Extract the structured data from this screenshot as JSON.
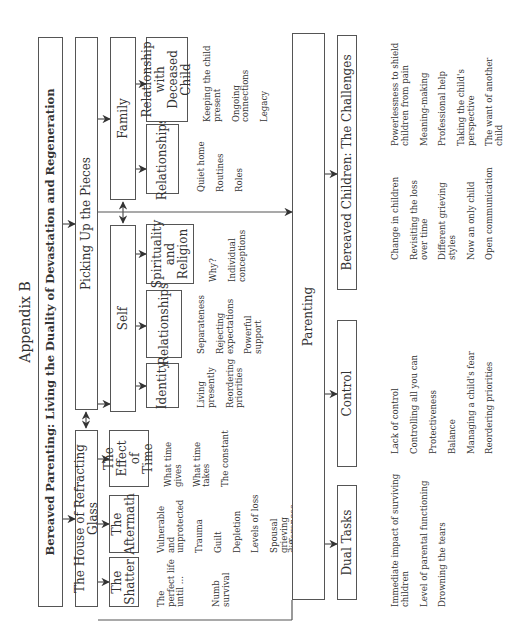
{
  "appendix_label": "Appendix B",
  "title": "Bereaved Parenting: Living the Duality of Devastation and Regeneration",
  "branches": {
    "house": {
      "label": "The House of Refracting Glass",
      "children": [
        {
          "label": "The Shatter",
          "notes": [
            "The perfect life until ...",
            "",
            "Numb survival"
          ]
        },
        {
          "label": "The Aftermath",
          "notes": [
            "Vulnerable and unprotected",
            "Trauma",
            "Guilt",
            "Depletion",
            "Levels of loss",
            "Spousal grieving differences"
          ]
        },
        {
          "label": "The Effect of Time",
          "notes": [
            "What time gives",
            "What time takes",
            "The constant"
          ]
        }
      ]
    },
    "pieces": {
      "label": "Picking Up the Pieces",
      "self": {
        "label": "Self",
        "children": [
          {
            "label": "Identity",
            "notes": [
              "Living presently",
              "Reordering priorities"
            ]
          },
          {
            "label": "Relationships",
            "notes": [
              "Separateness",
              "Rejecting expectations",
              "Powerful support"
            ]
          },
          {
            "label": "Spirituality and Religion",
            "notes": [
              "Why?",
              "Individual conceptions"
            ]
          }
        ]
      },
      "family": {
        "label": "Family",
        "children": [
          {
            "label": "Relationships",
            "notes": [
              "Quiet home",
              "Routines",
              "Roles"
            ]
          },
          {
            "label": "Relationship with Deceased Child",
            "notes": [
              "Keeping the child present",
              "Ongoing connections",
              "Legacy"
            ]
          }
        ]
      }
    }
  },
  "parenting": {
    "label": "Parenting",
    "children": [
      {
        "label": "Dual Tasks",
        "notes": [
          "Immediate impact of surviving children",
          "Level of parental functioning",
          "Drowning the tears"
        ]
      },
      {
        "label": "Control",
        "notes": [
          "Lack of control",
          "Controlling all you can",
          "Protectiveness",
          "Balance",
          "Managing a child's fear",
          "Reordering priorities"
        ]
      },
      {
        "label": "Bereaved Children: The Challenges",
        "notes_left": [
          "Change in children",
          "Revisiting the loss over time",
          "Different grieving styles",
          "Now an only child",
          "Open communication"
        ],
        "notes_right": [
          "Powerlessness to shield children from pain",
          "Meaning-making",
          "Professional help",
          "Taking the child's perspective",
          "The want of another child"
        ]
      }
    ]
  },
  "colors": {
    "line": "#555555",
    "text": "#333333",
    "background": "#ffffff"
  }
}
